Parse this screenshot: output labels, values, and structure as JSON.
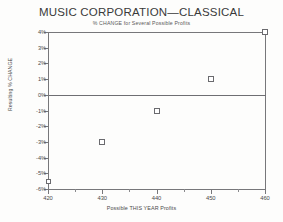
{
  "chart_data": {
    "type": "scatter",
    "title": "MUSIC CORPORATION—CLASSICAL",
    "subtitle": "% CHANGE for Several Possible Profits",
    "xlabel": "Possible THIS YEAR Profits",
    "ylabel": "Resulting % CHANGE",
    "xlim": [
      420,
      460
    ],
    "ylim": [
      -6,
      4
    ],
    "grid": false,
    "legend": null,
    "x_ticks": [
      420,
      430,
      440,
      450,
      460
    ],
    "x_tick_labels": [
      "420",
      "430",
      "440",
      "450",
      "460"
    ],
    "x_minor_ticks": [
      425,
      435,
      445,
      455
    ],
    "y_ticks": [
      4,
      3,
      2,
      1,
      0,
      -1,
      -2,
      -3,
      -4,
      -5,
      -6
    ],
    "y_tick_labels": [
      "4%",
      "3%",
      "2%",
      "1%",
      "0%",
      "-1%",
      "-2%",
      "-3%",
      "-4%",
      "-5%",
      "-6%"
    ],
    "zero_line": 0,
    "marker_style": "open-square",
    "points": [
      {
        "x": 430,
        "y": -3.0
      },
      {
        "x": 440,
        "y": -1.0
      },
      {
        "x": 450,
        "y": 1.0
      },
      {
        "x": 460,
        "y": 4.0
      }
    ],
    "axis_points": [
      {
        "x": 420,
        "y": -5.5
      }
    ]
  }
}
